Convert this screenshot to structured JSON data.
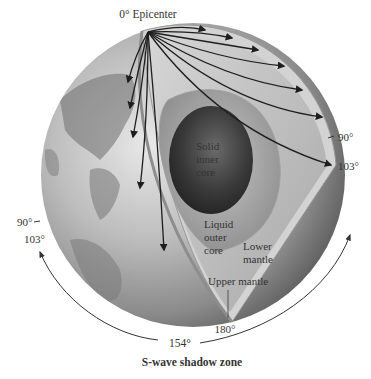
{
  "diagram": {
    "title": "S-wave shadow zone",
    "epicenter_label": "0° Epicenter",
    "layers": {
      "inner_core": [
        "Solid",
        "inner",
        "core"
      ],
      "outer_core": [
        "Liquid",
        "outer",
        "core"
      ],
      "lower_mantle": [
        "Lower",
        "mantle"
      ],
      "upper_mantle": "Upper mantle"
    },
    "angle_labels": {
      "right_90": "90°",
      "right_103": "103°",
      "left_90": "90°",
      "left_103": "103°",
      "bottom_180": "180°",
      "shadow_154": "154°"
    },
    "colors": {
      "inner_core": "#3a3a3a",
      "outer_core": "#9a9a9a",
      "mantle": "#b8b8b8",
      "crust": "#d0d0d0",
      "ray": "#1e1e1e",
      "globe_surface": "#8c8c8c"
    }
  }
}
